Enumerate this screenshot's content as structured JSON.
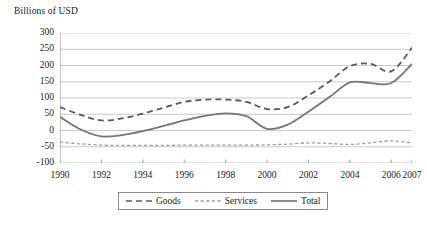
{
  "chart_data": {
    "type": "line",
    "title": "",
    "ylabel": "Billions of USD",
    "xlabel": "",
    "ylim": [
      -100,
      300
    ],
    "ytick_step": 50,
    "yticks": [
      300,
      250,
      200,
      150,
      100,
      50,
      0,
      -50,
      -100
    ],
    "ytick_labels": [
      "300",
      "250",
      "200",
      "150",
      "100",
      "50",
      "0",
      "-50",
      "-100"
    ],
    "grid": true,
    "grid_axis": "y",
    "legend_position": "bottom-center",
    "x": [
      1990,
      1991,
      1992,
      1993,
      1994,
      1995,
      1996,
      1997,
      1998,
      1999,
      2000,
      2001,
      2002,
      2003,
      2004,
      2005,
      2006,
      2007
    ],
    "xtick_values": [
      1990,
      1992,
      1994,
      1996,
      1998,
      2000,
      2002,
      2004,
      2006,
      2007
    ],
    "xtick_labels": [
      "1990",
      "1992",
      "1994",
      "1996",
      "1998",
      "2000",
      "2002",
      "2004",
      "2006",
      "2007"
    ],
    "series": [
      {
        "name": "Goods",
        "style": "dashed",
        "color": "#595959",
        "values": [
          72,
          48,
          31,
          37,
          52,
          70,
          88,
          95,
          95,
          88,
          66,
          72,
          108,
          150,
          198,
          205,
          182,
          255
        ]
      },
      {
        "name": "Services",
        "style": "dotted",
        "color": "#9e9e9e",
        "values": [
          -36,
          -41,
          -45,
          -46,
          -46,
          -46,
          -45,
          -45,
          -45,
          -45,
          -44,
          -42,
          -38,
          -40,
          -43,
          -38,
          -32,
          -38
        ]
      },
      {
        "name": "Total",
        "style": "solid",
        "color": "#777777",
        "values": [
          42,
          3,
          -18,
          -14,
          -2,
          14,
          31,
          45,
          53,
          44,
          5,
          18,
          58,
          102,
          148,
          146,
          146,
          205
        ]
      }
    ]
  },
  "legend": {
    "items": [
      {
        "label": "Goods"
      },
      {
        "label": "Services"
      },
      {
        "label": "Total"
      }
    ]
  }
}
